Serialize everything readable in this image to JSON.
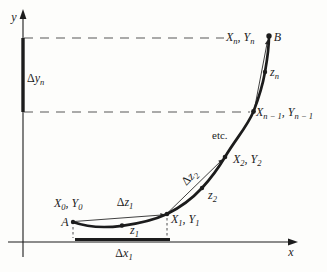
{
  "figure": {
    "colors": {
      "ink": "#1c1c1c",
      "dash": "#8f8f8f",
      "bg": "#fdfdfb"
    },
    "axes": {
      "x_label": "x",
      "y_label": "y"
    },
    "increments": {
      "delta_y_n": {
        "delta": "Δ",
        "var": "y",
        "sub": "n"
      },
      "delta_x_1": {
        "delta": "Δ",
        "var": "x",
        "sub": "1"
      },
      "delta_z_1": {
        "delta": "Δ",
        "var": "z",
        "sub": "1"
      },
      "delta_z_2": {
        "delta": "Δ",
        "var": "z",
        "sub": "2"
      }
    },
    "points": {
      "a": {
        "label": "A"
      },
      "b": {
        "label": "B"
      },
      "x0y0": {
        "v1": "X",
        "s1": "0",
        "sep": ",",
        "v2": "Y",
        "s2": "0"
      },
      "x1y1": {
        "v1": "X",
        "s1": "1",
        "sep": ",",
        "v2": "Y",
        "s2": "1"
      },
      "x2y2": {
        "v1": "X",
        "s1": "2",
        "sep": ",",
        "v2": "Y",
        "s2": "2"
      },
      "xn1yn1": {
        "v1": "X",
        "s1": "n − 1",
        "sep": ",",
        "v2": "Y",
        "s2": "n − 1"
      },
      "xnyn": {
        "v1": "X",
        "s1": "n",
        "sep": ",",
        "v2": "Y",
        "s2": "n"
      },
      "z1": {
        "v": "z",
        "s": "1"
      },
      "z2": {
        "v": "z",
        "s": "2"
      },
      "zn": {
        "v": "z",
        "s": "n"
      }
    },
    "annotations": {
      "etc": "etc."
    }
  }
}
